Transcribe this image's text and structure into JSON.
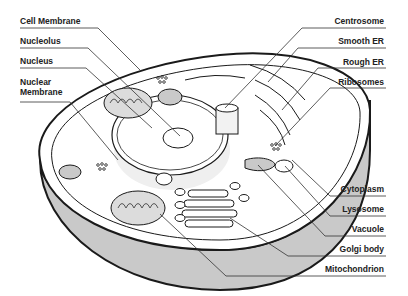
{
  "diagram": {
    "labels_left": [
      {
        "id": "cell-membrane",
        "text": "Cell Membrane",
        "y": 16
      },
      {
        "id": "nucleolus",
        "text": "Nucleolus",
        "y": 36
      },
      {
        "id": "nucleus",
        "text": "Nucleus",
        "y": 56
      },
      {
        "id": "nuclear-membrane",
        "text": "Nuclear\nMembrane",
        "line1": "Nuclear",
        "line2": "Membrane",
        "y": 77
      }
    ],
    "labels_right": [
      {
        "id": "centrosome",
        "text": "Centrosome",
        "y": 16
      },
      {
        "id": "smooth-er",
        "text": "Smooth ER",
        "y": 36
      },
      {
        "id": "rough-er",
        "text": "Rough ER",
        "y": 57
      },
      {
        "id": "ribosomes",
        "text": "Ribosomes",
        "y": 77
      },
      {
        "id": "cytoplasm",
        "text": "Cytoplasm",
        "y": 184
      },
      {
        "id": "lysosome",
        "text": "Lysosome",
        "y": 204
      },
      {
        "id": "vacuole",
        "text": "Vacuole",
        "y": 224
      },
      {
        "id": "golgi-body",
        "text": "Golgi body",
        "y": 244
      },
      {
        "id": "mitochondrion",
        "text": "Mitochondrion",
        "y": 264
      }
    ],
    "colors": {
      "outline": "#1a1a1a",
      "fill_gray": "#c8c8c8",
      "inner_gray": "#e6e6e6",
      "background": "#ffffff"
    }
  }
}
